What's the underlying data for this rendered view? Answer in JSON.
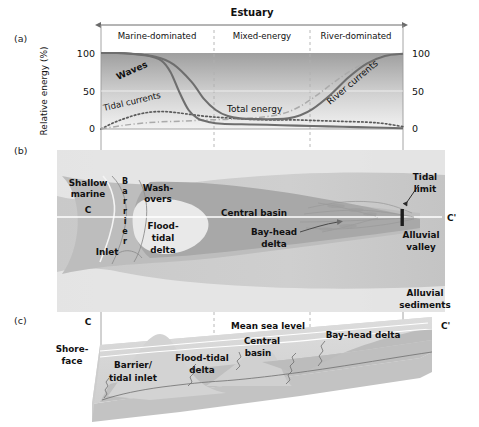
{
  "figure": {
    "panels": [
      {
        "id": "a",
        "label": "(a)"
      },
      {
        "id": "b",
        "label": "(b)"
      },
      {
        "id": "c",
        "label": "(c)"
      }
    ]
  },
  "panel_a": {
    "header_title": "Estuary",
    "zones": [
      "Marine-dominated",
      "Mixed-energy",
      "River-dominated"
    ],
    "y_axis_title": "Relative energy (%)",
    "y_ticks_left": [
      "100",
      "50",
      "0"
    ],
    "y_ticks_right": [
      "100",
      "50",
      "0"
    ],
    "curve_labels": {
      "waves": "Waves",
      "tidal_currents": "Tidal currents",
      "total_energy": "Total energy",
      "river_currents": "River currents"
    }
  },
  "panel_b": {
    "labels": {
      "shallow_marine": "Shallow\nmarine",
      "shallow_marine_line1": "Shallow",
      "shallow_marine_line2": "marine",
      "section_left": "C",
      "section_right": "C'",
      "barrier": "Barrier",
      "barrier_letters": [
        "B",
        "a",
        "r",
        "r",
        "i",
        "e",
        "r"
      ],
      "washovers_line1": "Wash-",
      "washovers_line2": "overs",
      "inlet": "Inlet",
      "flood_tidal_delta_line1": "Flood-",
      "flood_tidal_delta_line2": "tidal",
      "flood_tidal_delta_line3": "delta",
      "central_basin": "Central basin",
      "bay_head_delta_line1": "Bay-head",
      "bay_head_delta_line2": "delta",
      "tidal_limit_line1": "Tidal",
      "tidal_limit_line2": "limit",
      "alluvial_valley_line1": "Alluvial",
      "alluvial_valley_line2": "valley",
      "alluvial_sediments_line1": "Alluvial",
      "alluvial_sediments_line2": "sediments"
    }
  },
  "panel_c": {
    "labels": {
      "section_left": "C",
      "section_right": "C'",
      "shoreface_line1": "Shore-",
      "shoreface_line2": "face",
      "barrier_tidal_inlet_line1": "Barrier/",
      "barrier_tidal_inlet_line2": "tidal inlet",
      "flood_tidal_delta_line1": "Flood-tidal",
      "flood_tidal_delta_line2": "delta",
      "mean_sea_level": "Mean sea level",
      "central_basin_line1": "Central",
      "central_basin_line2": "basin",
      "bay_head_delta": "Bay-head delta"
    }
  },
  "chart_data": {
    "type": "line",
    "title": "Estuary",
    "xlabel": "",
    "ylabel": "Relative energy (%)",
    "ylim": [
      0,
      100
    ],
    "xlim": [
      0,
      100
    ],
    "grid": false,
    "legend": "inline-annotations",
    "zone_boundaries_pct": [
      0,
      37.5,
      69,
      100
    ],
    "zone_names": [
      "Marine-dominated",
      "Mixed-energy",
      "River-dominated"
    ],
    "series": [
      {
        "name": "Waves",
        "style": "solid",
        "color": "#6e6e6e",
        "x": [
          0,
          5,
          10,
          15,
          20,
          23,
          26,
          29,
          32,
          36,
          40,
          50,
          60,
          70,
          80,
          90,
          100
        ],
        "y": [
          100,
          100,
          99,
          97,
          90,
          75,
          48,
          25,
          14,
          9,
          7,
          6,
          5,
          4,
          3,
          2,
          1
        ]
      },
      {
        "name": "Total energy",
        "style": "solid",
        "color": "#6e6e6e",
        "x": [
          0,
          5,
          10,
          18,
          24,
          30,
          34,
          38,
          42,
          46,
          52,
          58,
          62,
          66,
          70,
          76,
          82,
          88,
          94,
          100
        ],
        "y": [
          100,
          100,
          99,
          95,
          85,
          62,
          40,
          25,
          17,
          14,
          13,
          13,
          14,
          18,
          26,
          45,
          68,
          86,
          96,
          99
        ]
      },
      {
        "name": "Tidal currents",
        "style": "dotted",
        "color": "#5a5a5a",
        "x": [
          0,
          4,
          8,
          12,
          16,
          20,
          24,
          28,
          34,
          40,
          48,
          56,
          64,
          72,
          80,
          88,
          94,
          100
        ],
        "y": [
          0,
          8,
          14,
          19,
          22,
          23,
          22,
          20,
          17,
          15,
          13,
          12,
          12,
          11,
          10,
          9,
          7,
          3
        ]
      },
      {
        "name": "River currents",
        "style": "dash-dot",
        "color": "#aaaaaa",
        "x": [
          0,
          6,
          12,
          18,
          24,
          30,
          36,
          44,
          52,
          60,
          66,
          72,
          78,
          84,
          90,
          95,
          100
        ],
        "y": [
          0,
          4,
          7,
          9,
          10,
          11,
          12,
          13,
          15,
          20,
          30,
          46,
          64,
          80,
          92,
          97,
          99
        ]
      }
    ],
    "annotations": [
      {
        "text": "Waves",
        "x": 14,
        "y": 72,
        "rotation": -22
      },
      {
        "text": "Tidal currents",
        "x": 10,
        "y": 26,
        "rotation": -14
      },
      {
        "text": "Total energy",
        "x": 50,
        "y": 20,
        "rotation": 0
      },
      {
        "text": "River currents",
        "x": 79,
        "y": 52,
        "rotation": -38
      }
    ]
  }
}
